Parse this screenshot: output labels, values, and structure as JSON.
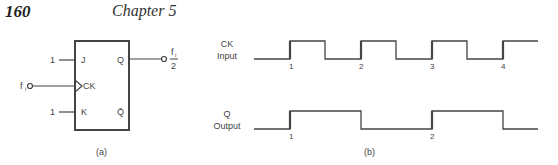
{
  "header": {
    "page_number": "160",
    "chapter": "Chapter 5"
  },
  "figure_a": {
    "caption": "(a)",
    "flipflop": {
      "pins": {
        "j": "J",
        "k": "K",
        "ck": "CK",
        "q": "Q",
        "q_bar": "Q̄"
      },
      "inputs": {
        "j_value": "1",
        "k_value": "1",
        "clock_input": "f",
        "clock_input_sub": "i"
      },
      "output": {
        "numerator": "f",
        "numerator_sub": "i",
        "denominator": "2"
      }
    }
  },
  "figure_b": {
    "caption": "(b)",
    "ck_label_line1": "CK",
    "ck_label_line2": "Input",
    "q_label_line1": "Q",
    "q_label_line2": "Output",
    "ck_edge_labels": [
      "1",
      "2",
      "3",
      "4"
    ],
    "q_edge_labels": [
      "1",
      "2"
    ]
  }
}
